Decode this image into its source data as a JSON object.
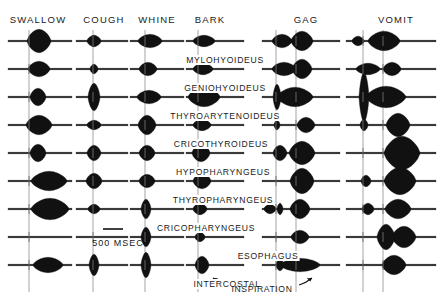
{
  "figure": {
    "scale_bar": {
      "label": "500 MSEC",
      "x": 118,
      "y": 238,
      "bar_x1": 103,
      "bar_x2": 123,
      "bar_y": 229
    },
    "inspiration": {
      "label": "INSPIRATION",
      "x": 262,
      "y": 284
    },
    "ink_color": "#111111",
    "axis_color": "#9a9a9a",
    "background": "#ffffff"
  },
  "columns": [
    {
      "key": "swallow",
      "label": "SWALLOW",
      "header_x": 38,
      "header_y": 14,
      "lines": [
        29
      ]
    },
    {
      "key": "cough",
      "label": "COUGH",
      "header_x": 104,
      "header_y": 14,
      "lines": [
        93
      ]
    },
    {
      "key": "whine",
      "label": "WHINE",
      "header_x": 157,
      "header_y": 14,
      "lines": [
        145
      ]
    },
    {
      "key": "bark",
      "label": "BARK",
      "header_x": 210,
      "header_y": 14,
      "lines": [
        198
      ]
    },
    {
      "key": "gag",
      "label": "GAG",
      "header_x": 306,
      "header_y": 14,
      "lines": [
        276,
        296
      ]
    },
    {
      "key": "vomit",
      "label": "VOMIT",
      "header_x": 396,
      "header_y": 14,
      "lines": [
        363,
        383
      ]
    }
  ],
  "rows": [
    {
      "key": "mylohyoideus",
      "label": "MYLOHYOIDEUS",
      "y": 41,
      "label_x": 225,
      "label_y": 55
    },
    {
      "key": "geniohyoideus",
      "label": "GENIOHYOIDEUS",
      "y": 69,
      "label_x": 225,
      "label_y": 83
    },
    {
      "key": "thyroarytenoideus",
      "label": "THYROARYTENOIDEUS",
      "y": 97,
      "label_x": 225,
      "label_y": 111
    },
    {
      "key": "cricothyroideus",
      "label": "CRICOTHYROIDEUS",
      "y": 125,
      "label_x": 221,
      "label_y": 139
    },
    {
      "key": "hypopharyngeus",
      "label": "HYPOPHARYNGEUS",
      "y": 153,
      "label_x": 223,
      "label_y": 167
    },
    {
      "key": "thyropharyngeus",
      "label": "THYROPHARYNGEUS",
      "y": 181,
      "label_x": 223,
      "label_y": 195
    },
    {
      "key": "cricopharyngeus",
      "label": "CRICOPHARYNGEUS",
      "y": 209,
      "label_x": 206,
      "label_y": 223
    },
    {
      "key": "esophagus",
      "label": "ESOPHAGUS",
      "y": 237,
      "label_x": 268,
      "label_y": 251
    },
    {
      "key": "intercostal",
      "label": "INTERCOSTAL",
      "y": 265,
      "label_x": 227,
      "label_y": 279
    }
  ],
  "chart_data": {
    "type": "line",
    "xlabel": "time (500 msec scale bar)",
    "ylabel": "muscle",
    "categories": [
      "SWALLOW",
      "COUGH",
      "WHINE",
      "BARK",
      "GAG",
      "VOMIT"
    ],
    "rows": [
      "MYLOHYOIDEUS",
      "GENIOHYOIDEUS",
      "THYROARYTENOIDEUS",
      "CRICOTHYROIDEUS",
      "HYPOPHARYNGEUS",
      "THYROPHARYNGEUS",
      "CRICOPHARYNGEUS",
      "ESOPHAGUS",
      "INTERCOSTAL"
    ],
    "note": "Each cell is an EMG trace; bursts given as {center, halfwidth, amplitude} in px relative to column trace start.",
    "traces": {
      "swallow": {
        "x0": 8,
        "x1": 72,
        "bursts": [
          [
            {
              "c": 31,
              "w": 12,
              "a": 11
            }
          ],
          [
            {
              "c": 31,
              "w": 11,
              "a": 7
            }
          ],
          [
            {
              "c": 30,
              "w": 8,
              "a": 8
            }
          ],
          [
            {
              "c": 31,
              "w": 13,
              "a": 9
            }
          ],
          [
            {
              "c": 30,
              "w": 8,
              "a": 8
            }
          ],
          [
            {
              "c": 41,
              "w": 18,
              "a": 9
            }
          ],
          [
            {
              "c": 42,
              "w": 19,
              "a": 10
            }
          ],
          [],
          [
            {
              "c": 40,
              "w": 15,
              "a": 7
            }
          ]
        ]
      },
      "cough": {
        "x0": 76,
        "x1": 128,
        "bursts": [
          [
            {
              "c": 18,
              "w": 7,
              "a": 5
            }
          ],
          [
            {
              "c": 18,
              "w": 4,
              "a": 4
            }
          ],
          [
            {
              "c": 18,
              "w": 6,
              "a": 13
            }
          ],
          [
            {
              "c": 18,
              "w": 7,
              "a": 4
            }
          ],
          [
            {
              "c": 18,
              "w": 7,
              "a": 7
            }
          ],
          [
            {
              "c": 18,
              "w": 8,
              "a": 7
            }
          ],
          [
            {
              "c": 18,
              "w": 6,
              "a": 4
            }
          ],
          [],
          [
            {
              "c": 18,
              "w": 5,
              "a": 10
            }
          ]
        ]
      },
      "whine": {
        "x0": 130,
        "x1": 184,
        "bursts": [
          [
            {
              "c": 20,
              "w": 12,
              "a": 6
            }
          ],
          [
            {
              "c": 18,
              "w": 9,
              "a": 6
            }
          ],
          [
            {
              "c": 19,
              "w": 12,
              "a": 6
            }
          ],
          [
            {
              "c": 17,
              "w": 9,
              "a": 9
            }
          ],
          [
            {
              "c": 17,
              "w": 8,
              "a": 7
            }
          ],
          [
            {
              "c": 17,
              "w": 8,
              "a": 6
            }
          ],
          [
            {
              "c": 16,
              "w": 5,
              "a": 9
            }
          ],
          [
            {
              "c": 16,
              "w": 5,
              "a": 9
            }
          ],
          [
            {
              "c": 16,
              "w": 5,
              "a": 12
            }
          ]
        ]
      },
      "bark": {
        "x0": 186,
        "x1": 244,
        "bursts": [
          [
            {
              "c": 18,
              "w": 11,
              "a": 5
            }
          ],
          [
            {
              "c": 17,
              "w": 10,
              "a": 5
            }
          ],
          [
            {
              "c": 18,
              "w": 16,
              "a": 9
            }
          ],
          [
            {
              "c": 16,
              "w": 9,
              "a": 5
            }
          ],
          [
            {
              "c": 15,
              "w": 9,
              "a": 8
            }
          ],
          [
            {
              "c": 16,
              "w": 9,
              "a": 7
            }
          ],
          [
            {
              "c": 14,
              "w": 7,
              "a": 5
            }
          ],
          [
            {
              "c": 14,
              "w": 5,
              "a": 4
            }
          ],
          [
            {
              "c": 16,
              "w": 7,
              "a": 8
            }
          ]
        ]
      },
      "gag": {
        "x0": 262,
        "x1": 340,
        "bursts": [
          [
            {
              "c": 20,
              "w": 10,
              "a": 6
            },
            {
              "c": 40,
              "w": 11,
              "a": 9
            }
          ],
          [
            {
              "c": 22,
              "w": 12,
              "a": 6
            },
            {
              "c": 40,
              "w": 10,
              "a": 9
            }
          ],
          [
            {
              "c": 15,
              "w": 4,
              "a": 12
            },
            {
              "c": 33,
              "w": 18,
              "a": 9
            }
          ],
          [
            {
              "c": 15,
              "w": 3,
              "a": 4
            },
            {
              "c": 44,
              "w": 9,
              "a": 7
            }
          ],
          [
            {
              "c": 18,
              "w": 7,
              "a": 7
            },
            {
              "c": 40,
              "w": 13,
              "a": 11
            }
          ],
          [
            {
              "c": 40,
              "w": 12,
              "a": 12
            }
          ],
          [
            {
              "c": 8,
              "w": 6,
              "a": 4
            },
            {
              "c": 18,
              "w": 3,
              "a": 5
            },
            {
              "c": 38,
              "w": 10,
              "a": 9
            }
          ],
          [
            {
              "c": 38,
              "w": 9,
              "a": 6
            }
          ],
          [
            {
              "c": 18,
              "w": 4,
              "a": 5
            },
            {
              "c": 38,
              "w": 20,
              "a": 6
            }
          ]
        ]
      },
      "vomit": {
        "x0": 346,
        "x1": 436,
        "bursts": [
          [
            {
              "c": 12,
              "w": 6,
              "a": 4
            },
            {
              "c": 38,
              "w": 16,
              "a": 9
            }
          ],
          [
            {
              "c": 22,
              "w": 12,
              "a": 5
            },
            {
              "c": 46,
              "w": 9,
              "a": 6
            }
          ],
          [
            {
              "c": 18,
              "w": 5,
              "a": 24
            },
            {
              "c": 40,
              "w": 20,
              "a": 10
            }
          ],
          [
            {
              "c": 18,
              "w": 4,
              "a": 5
            },
            {
              "c": 52,
              "w": 12,
              "a": 11
            }
          ],
          [
            {
              "c": 56,
              "w": 18,
              "a": 16
            }
          ],
          [
            {
              "c": 20,
              "w": 5,
              "a": 5
            },
            {
              "c": 54,
              "w": 16,
              "a": 13
            }
          ],
          [
            {
              "c": 22,
              "w": 6,
              "a": 5
            },
            {
              "c": 52,
              "w": 13,
              "a": 9
            }
          ],
          [
            {
              "c": 40,
              "w": 9,
              "a": 12
            },
            {
              "c": 58,
              "w": 12,
              "a": 10
            }
          ],
          [
            {
              "c": 48,
              "w": 12,
              "a": 9
            }
          ]
        ]
      }
    }
  }
}
